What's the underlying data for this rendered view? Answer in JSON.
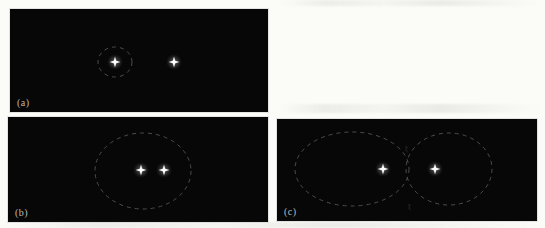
{
  "background_color": "#fbfbf8",
  "panel_bg": "#070707",
  "star_color": "#ffffff",
  "outline_color": "#4d4d4d",
  "label_color": "#bdbdb8",
  "panels": [
    {
      "label": "(a)",
      "box": {
        "left": 10,
        "top": 9,
        "width": 258,
        "height": 103
      },
      "stars": [
        {
          "x": 105,
          "y": 53
        },
        {
          "x": 164,
          "y": 53
        }
      ],
      "ellipses": [
        {
          "cx": 105,
          "cy": 53,
          "rx": 17,
          "ry": 15
        }
      ],
      "marks": []
    },
    {
      "label": "(b)",
      "box": {
        "left": 8,
        "top": 117,
        "width": 260,
        "height": 105
      },
      "stars": [
        {
          "x": 133,
          "y": 53
        },
        {
          "x": 156,
          "y": 53
        }
      ],
      "ellipses": [
        {
          "cx": 135,
          "cy": 54,
          "rx": 48,
          "ry": 38
        }
      ],
      "marks": []
    },
    {
      "label": "(c)",
      "box": {
        "left": 277,
        "top": 119,
        "width": 260,
        "height": 102
      },
      "stars": [
        {
          "x": 106,
          "y": 50
        },
        {
          "x": 158,
          "y": 50
        }
      ],
      "ellipses": [
        {
          "cx": 75,
          "cy": 50,
          "rx": 57,
          "ry": 37
        },
        {
          "cx": 172,
          "cy": 50,
          "rx": 43,
          "ry": 36
        }
      ],
      "marks": [
        {
          "x": 130,
          "y": 31
        },
        {
          "x": 133,
          "y": 89
        }
      ]
    }
  ]
}
